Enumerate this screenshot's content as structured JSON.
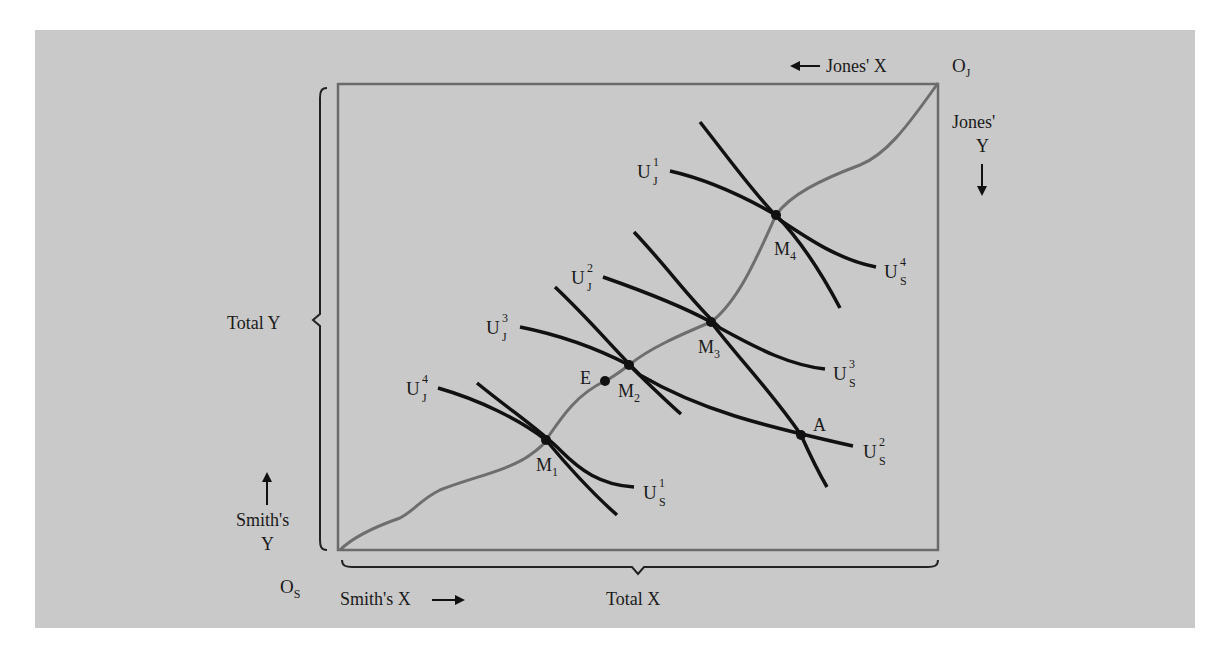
{
  "diagram": {
    "colors": {
      "panel_background": "#c9c9c9",
      "page_background": "#ffffff",
      "box_border": "#6b6b6b",
      "contract_curve": "#6e6e6e",
      "indifference_curves": "#111111",
      "text": "#1a1a1a"
    },
    "origins": {
      "smith": {
        "base": "O",
        "sub": "S"
      },
      "jones": {
        "base": "O",
        "sub": "J"
      }
    },
    "axis_labels": {
      "jones_x": "Jones' X",
      "jones_y_line1": "Jones'",
      "jones_y_line2": "Y",
      "smith_y_line1": "Smith's",
      "smith_y_line2": "Y",
      "smith_x": "Smith's X",
      "total_x": "Total X",
      "total_y": "Total Y"
    },
    "points": {
      "m1": {
        "base": "M",
        "sub": "1"
      },
      "m2": {
        "base": "M",
        "sub": "2"
      },
      "m3": {
        "base": "M",
        "sub": "3"
      },
      "m4": {
        "base": "M",
        "sub": "4"
      },
      "e": "E",
      "a": "A"
    },
    "curves": {
      "uj1": {
        "base": "U",
        "sup": "1",
        "sub": "J"
      },
      "uj2": {
        "base": "U",
        "sup": "2",
        "sub": "J"
      },
      "uj3": {
        "base": "U",
        "sup": "3",
        "sub": "J"
      },
      "uj4": {
        "base": "U",
        "sup": "4",
        "sub": "J"
      },
      "us1": {
        "base": "U",
        "sup": "1",
        "sub": "S"
      },
      "us2": {
        "base": "U",
        "sup": "2",
        "sub": "S"
      },
      "us3": {
        "base": "U",
        "sup": "3",
        "sub": "S"
      },
      "us4": {
        "base": "U",
        "sup": "4",
        "sub": "S"
      }
    }
  }
}
